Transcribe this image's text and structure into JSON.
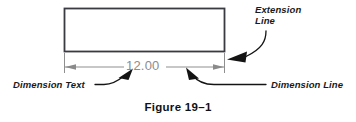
{
  "figure": {
    "caption": "Figure 19–1",
    "dimension_value": "12.00"
  },
  "labels": {
    "extension_line_1": "Extension",
    "extension_line_2": "Line",
    "dimension_text": "Dimension Text",
    "dimension_line": "Dimension Line"
  },
  "colors": {
    "object_line": "#3a3a42",
    "dimension_gray": "#8c8c8c",
    "leader_black": "#111111",
    "text_black": "#1a1a1a",
    "background": "#ffffff"
  },
  "geometry": {
    "rectangle": {
      "x": 64,
      "y": 8,
      "width": 161,
      "height": 44
    },
    "dimension_line_y": 67,
    "extension_line_left_x": 64,
    "extension_line_right_x": 225,
    "extension_line_bottom_y": 73
  }
}
